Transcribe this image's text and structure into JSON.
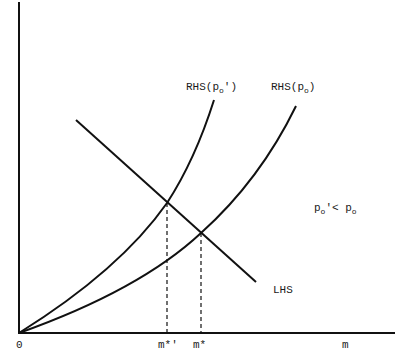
{
  "diagram": {
    "axes": {
      "origin_label": "0",
      "x_label": "m"
    },
    "curves": {
      "rhs_po_prime": {
        "label_main": "RHS(p",
        "label_sub": "o",
        "label_end": "')"
      },
      "rhs_po": {
        "label_main": "RHS(p",
        "label_sub": "o",
        "label_end": ")"
      },
      "lhs": {
        "label": "LHS"
      }
    },
    "equilibria": {
      "m_star_prime": "m*'",
      "m_star": "m*"
    },
    "annotation": {
      "p1": "p",
      "s1": "o",
      "mid": "'< p",
      "s2": "o"
    },
    "colors": {
      "ink": "#111111",
      "background": "#ffffff"
    }
  }
}
